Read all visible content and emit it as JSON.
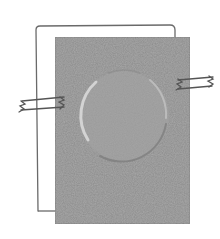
{
  "illustration": {
    "subject": "sketch of embossed card taped over outlined sheet",
    "colors": {
      "background": "#ffffff",
      "card_fill": "#a9a9a9",
      "outline_stroke": "#6a6a6a",
      "tape_stroke": "#555555",
      "emboss_highlight": "#d8d8d8",
      "emboss_shadow": "#7e7e7e"
    },
    "back_sheet": {
      "x": 36,
      "y": 25,
      "width": 139,
      "height": 186
    },
    "card": {
      "x": 55,
      "y": 37,
      "width": 135,
      "height": 187
    },
    "emboss_circle": {
      "cx": 124,
      "cy": 116,
      "r": 45
    },
    "tapes": [
      {
        "side": "left",
        "x": 20,
        "y": 97,
        "width": 46,
        "height": 14
      },
      {
        "side": "right",
        "x": 176,
        "y": 76,
        "width": 39,
        "height": 12
      }
    ]
  }
}
